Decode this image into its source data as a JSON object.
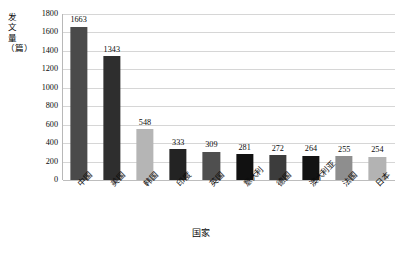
{
  "chart_data": {
    "type": "bar",
    "title": "",
    "subtitle": "",
    "xlabel": "国家",
    "ylabel": "发文量（篇）",
    "ylim": [
      0,
      1800
    ],
    "grid": true,
    "legend": "none",
    "categories": [
      "中国",
      "美国",
      "韩国",
      "印度",
      "英国",
      "意大利",
      "德国",
      "澳大利亚",
      "法国",
      "日本"
    ],
    "values": [
      1663,
      1343,
      548,
      333,
      309,
      281,
      272,
      264,
      255,
      254
    ],
    "value_labels": [
      "1663",
      "1343",
      "548",
      "333",
      "309",
      "281",
      "272",
      "264",
      "255",
      "254"
    ],
    "bar_colors": [
      "#4a4a4a",
      "#2e2e2e",
      "#b5b5b5",
      "#232323",
      "#4f4f4f",
      "#111111",
      "#3c3c3c",
      "#131313",
      "#8e8e8e",
      "#b3b3b3"
    ],
    "yticks": [
      0,
      200,
      400,
      600,
      800,
      1000,
      1200,
      1400,
      1600,
      1800
    ],
    "ytick_labels": [
      "0",
      "200",
      "400",
      "600",
      "800",
      "1000",
      "1200",
      "1400",
      "1600",
      "1800"
    ],
    "axis_color": "#b8b8b8",
    "gridline_color": "#d6d6d6",
    "text_color": "#0b0b0b",
    "background": "#ffffff"
  }
}
